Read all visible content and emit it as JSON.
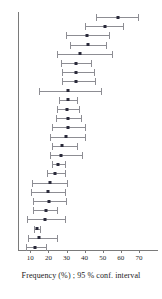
{
  "chart_data": {
    "type": "scatter",
    "plot_style": "forest-plot-confidence-intervals",
    "title": "",
    "subtitle": "",
    "xlabel": "Frequency (%) ; 95 % conf. interval",
    "ylabel": "",
    "xlim": [
      3,
      73
    ],
    "ylim": [
      0,
      24
    ],
    "grid": false,
    "legend": null,
    "axis_ticks": [
      10,
      20,
      30,
      40,
      50,
      60,
      70
    ],
    "tick_labels": [
      "10",
      "20",
      "30",
      "40",
      "50",
      "60",
      "70"
    ],
    "point_color": "#2a2a3a",
    "interval_color": "#8d8d93",
    "axis_color": "#7a7a7a",
    "n_rows": 24,
    "series": [
      {
        "name": "Frequency (%) with 95 % confidence interval",
        "estimates": [
          58.5,
          51.5,
          41.5,
          42.0,
          37.5,
          35.5,
          35.5,
          35.5,
          31.0,
          31.0,
          30.5,
          31.0,
          31.0,
          30.0,
          27.5,
          27.0,
          25.5,
          23.5,
          21.0,
          20.0,
          20.5,
          18.5,
          18.0,
          13.5,
          15.0,
          12.5
        ],
        "lower": [
          46.5,
          40.0,
          29.5,
          32.0,
          24.5,
          27.0,
          27.5,
          27.5,
          15.0,
          26.0,
          25.0,
          24.0,
          22.0,
          21.0,
          22.0,
          21.0,
          22.0,
          19.0,
          11.0,
          10.5,
          11.5,
          11.5,
          8.0,
          12.0,
          8.5,
          7.5
        ],
        "upper": [
          70.0,
          61.5,
          54.0,
          52.5,
          55.5,
          44.0,
          46.0,
          46.5,
          49.5,
          36.5,
          37.5,
          38.5,
          40.5,
          41.0,
          36.5,
          39.0,
          29.5,
          30.0,
          31.0,
          30.0,
          30.5,
          25.5,
          30.0,
          16.0,
          25.5,
          19.5
        ]
      }
    ],
    "rows": [
      {
        "index": 1,
        "estimate": 58.5,
        "lower": 46.5,
        "upper": 70.0
      },
      {
        "index": 2,
        "estimate": 51.5,
        "lower": 40.0,
        "upper": 61.5
      },
      {
        "index": 3,
        "estimate": 41.5,
        "lower": 29.5,
        "upper": 54.0
      },
      {
        "index": 4,
        "estimate": 42.0,
        "lower": 32.0,
        "upper": 52.5
      },
      {
        "index": 5,
        "estimate": 37.5,
        "lower": 24.5,
        "upper": 55.5
      },
      {
        "index": 6,
        "estimate": 35.5,
        "lower": 27.0,
        "upper": 44.0
      },
      {
        "index": 7,
        "estimate": 35.5,
        "lower": 27.5,
        "upper": 46.0
      },
      {
        "index": 8,
        "estimate": 35.5,
        "lower": 27.5,
        "upper": 46.5
      },
      {
        "index": 9,
        "estimate": 31.0,
        "lower": 15.0,
        "upper": 49.5
      },
      {
        "index": 10,
        "estimate": 31.0,
        "lower": 26.0,
        "upper": 36.5
      },
      {
        "index": 11,
        "estimate": 30.5,
        "lower": 25.0,
        "upper": 37.5
      },
      {
        "index": 12,
        "estimate": 31.0,
        "lower": 24.0,
        "upper": 38.5
      },
      {
        "index": 13,
        "estimate": 31.0,
        "lower": 22.0,
        "upper": 40.5
      },
      {
        "index": 14,
        "estimate": 30.0,
        "lower": 21.0,
        "upper": 41.0
      },
      {
        "index": 15,
        "estimate": 27.5,
        "lower": 22.0,
        "upper": 36.5
      },
      {
        "index": 16,
        "estimate": 27.0,
        "lower": 21.0,
        "upper": 39.0
      },
      {
        "index": 17,
        "estimate": 25.5,
        "lower": 22.0,
        "upper": 29.5
      },
      {
        "index": 18,
        "estimate": 23.5,
        "lower": 19.0,
        "upper": 30.0
      },
      {
        "index": 19,
        "estimate": 21.0,
        "lower": 11.0,
        "upper": 31.0
      },
      {
        "index": 20,
        "estimate": 20.0,
        "lower": 10.5,
        "upper": 30.0
      },
      {
        "index": 21,
        "estimate": 20.5,
        "lower": 11.5,
        "upper": 30.5
      },
      {
        "index": 22,
        "estimate": 18.5,
        "lower": 11.5,
        "upper": 25.5
      },
      {
        "index": 23,
        "estimate": 18.0,
        "lower": 8.0,
        "upper": 30.0
      },
      {
        "index": 24,
        "estimate": 13.5,
        "lower": 12.0,
        "upper": 16.0
      },
      {
        "index": 25,
        "estimate": 15.0,
        "lower": 8.5,
        "upper": 25.5
      },
      {
        "index": 26,
        "estimate": 12.5,
        "lower": 7.5,
        "upper": 19.5
      }
    ]
  }
}
